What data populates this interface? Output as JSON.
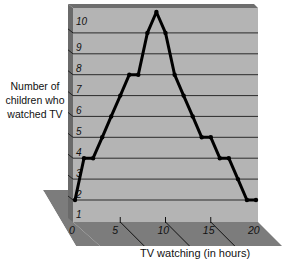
{
  "chart_data": {
    "type": "line",
    "title": "",
    "xlabel": "TV watching (in hours)",
    "ylabel": "Number of children who watched TV",
    "x": [
      0,
      1,
      2,
      3,
      4,
      5,
      6,
      7,
      8,
      9,
      10,
      11,
      12,
      13,
      14,
      15,
      16,
      17,
      18,
      19,
      20
    ],
    "values": [
      1,
      3,
      3,
      4,
      5,
      6,
      7,
      7,
      9,
      10,
      9,
      7,
      6,
      5,
      4,
      4,
      3,
      3,
      2,
      1,
      1
    ],
    "xlim": [
      0,
      20
    ],
    "ylim": [
      0,
      10
    ],
    "xticks": [
      "0",
      "5",
      "10",
      "15",
      "20"
    ],
    "yticks": [
      "1",
      "2",
      "3",
      "4",
      "5",
      "6",
      "7",
      "8",
      "9",
      "10"
    ],
    "grid": true,
    "style": "3d-panel"
  },
  "labels": {
    "ylabel_lines": [
      "Number of",
      "children who",
      "watched TV"
    ],
    "xlabel": "TV watching (in hours)"
  },
  "colors": {
    "panel": "#b4b4b4",
    "floor": "#7c7c7c",
    "edge": "#5a5a5a",
    "line": "#000000"
  }
}
